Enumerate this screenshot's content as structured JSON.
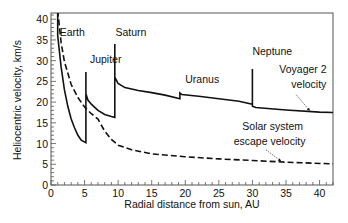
{
  "chart_data": {
    "type": "line",
    "title": "",
    "xlabel": "Radial distance from sun, AU",
    "ylabel": "Heliocentric velocity, km/s",
    "xlim": [
      0,
      42
    ],
    "ylim": [
      0,
      41.5
    ],
    "xticks": [
      0,
      5,
      10,
      15,
      20,
      25,
      30,
      35,
      40
    ],
    "yticks": [
      0,
      5,
      10,
      15,
      20,
      25,
      30,
      35,
      40
    ],
    "grid": false,
    "series": [
      {
        "name": "Voyager 2 velocity",
        "style": "solid",
        "points": [
          [
            1.0,
            41.5
          ],
          [
            1.0,
            36.0
          ],
          [
            1.5,
            28.5
          ],
          [
            2.0,
            23.0
          ],
          [
            2.5,
            19.0
          ],
          [
            3.0,
            16.0
          ],
          [
            3.5,
            13.8
          ],
          [
            4.0,
            12.0
          ],
          [
            4.5,
            10.8
          ],
          [
            5.2,
            10.2
          ],
          [
            5.2,
            27.3
          ],
          [
            5.2,
            22.0
          ],
          [
            5.5,
            20.5
          ],
          [
            6.0,
            19.5
          ],
          [
            7.0,
            18.0
          ],
          [
            8.0,
            17.0
          ],
          [
            9.0,
            16.5
          ],
          [
            9.5,
            16.3
          ],
          [
            9.5,
            34.0
          ],
          [
            9.5,
            26.0
          ],
          [
            10.0,
            24.5
          ],
          [
            11.0,
            23.5
          ],
          [
            13.0,
            22.8
          ],
          [
            15.0,
            22.3
          ],
          [
            17.0,
            21.7
          ],
          [
            19.2,
            20.8
          ],
          [
            19.2,
            22.2
          ],
          [
            19.5,
            21.8
          ],
          [
            22.0,
            21.4
          ],
          [
            25.0,
            20.8
          ],
          [
            28.0,
            20.2
          ],
          [
            30.0,
            19.5
          ],
          [
            30.0,
            28.0
          ],
          [
            30.0,
            19.0
          ],
          [
            30.5,
            18.7
          ],
          [
            35.0,
            18.1
          ],
          [
            40.0,
            17.6
          ],
          [
            42.0,
            17.5
          ]
        ]
      },
      {
        "name": "Solar system escape velocity",
        "style": "dashed",
        "points": [
          [
            1.0,
            42.1
          ],
          [
            1.5,
            34.4
          ],
          [
            2.0,
            29.8
          ],
          [
            3.0,
            24.3
          ],
          [
            4.0,
            21.1
          ],
          [
            5.0,
            18.8
          ],
          [
            6.0,
            17.2
          ],
          [
            7.0,
            15.9
          ],
          [
            8.0,
            13.0
          ],
          [
            9.0,
            11.0
          ],
          [
            10.0,
            9.6
          ],
          [
            12.0,
            8.5
          ],
          [
            15.0,
            7.5
          ],
          [
            20.0,
            6.8
          ],
          [
            25.0,
            6.3
          ],
          [
            30.0,
            5.9
          ],
          [
            35.0,
            5.5
          ],
          [
            42.0,
            5.1
          ]
        ]
      }
    ],
    "annotations": [
      {
        "text": "Earth",
        "x": 1.3,
        "y": 36.0
      },
      {
        "text": "Jupiter",
        "x": 5.8,
        "y": 29.5
      },
      {
        "text": "Saturn",
        "x": 9.6,
        "y": 36.0
      },
      {
        "text": "Uranus",
        "x": 20.0,
        "y": 24.5
      },
      {
        "text": "Neptune",
        "x": 30.0,
        "y": 31.3
      },
      {
        "text": "Voyager 2",
        "x": 34.0,
        "y": 27.0
      },
      {
        "text": "velocity",
        "x": 35.8,
        "y": 23.3
      },
      {
        "text": "Solar system",
        "x": 28.5,
        "y": 13.3
      },
      {
        "text": "escape velocity",
        "x": 27.2,
        "y": 9.6
      }
    ],
    "arrows": [
      {
        "from": [
          36.5,
          21.8
        ],
        "to": [
          38.5,
          18.0
        ]
      },
      {
        "from": [
          32.0,
          8.5
        ],
        "to": [
          34.2,
          5.8
        ]
      }
    ]
  }
}
